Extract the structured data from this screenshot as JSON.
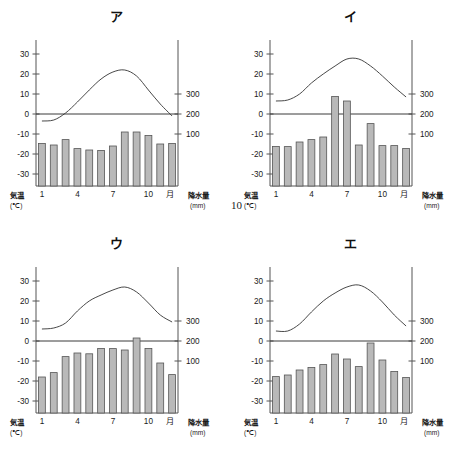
{
  "figure": {
    "page_number": "10",
    "axis": {
      "left_caption": "気温",
      "left_unit": "(℃)",
      "right_caption": "降水量",
      "right_unit": "(mm)",
      "month_caption": "月",
      "temp_ticks": [
        "30",
        "20",
        "10",
        "0",
        "-10",
        "-20",
        "-30"
      ],
      "precip_ticks": [
        "300",
        "200",
        "100"
      ],
      "month_ticks": [
        "1",
        "4",
        "7",
        "10"
      ]
    },
    "colors": {
      "bar_fill": "#b9b9b9",
      "bar_stroke": "#555555",
      "axis": "#555555",
      "curve": "#333333",
      "text": "#1a1a1a"
    }
  },
  "chart_data": [
    {
      "type": "bar",
      "title": "ア",
      "xlabel": "月",
      "ylabel": "気温 (℃)",
      "y2label": "降水量 (mm)",
      "categories": [
        "1",
        "2",
        "3",
        "4",
        "5",
        "6",
        "7",
        "8",
        "9",
        "10",
        "11",
        "12"
      ],
      "ylim": [
        -36,
        34
      ],
      "y2lim": [
        -320,
        1080
      ],
      "grid": false,
      "legend": "none",
      "series": [
        {
          "name": "降水量",
          "kind": "bar",
          "unit": "mm",
          "values": [
            53,
            45,
            72,
            27,
            20,
            18,
            40,
            110,
            110,
            93,
            50,
            53
          ]
        },
        {
          "name": "気温",
          "kind": "line",
          "unit": "℃",
          "values": [
            -3.5,
            -3.0,
            0.5,
            6.0,
            12.0,
            17.5,
            21.0,
            22.0,
            19.0,
            12.0,
            5.0,
            -1.0
          ]
        }
      ]
    },
    {
      "type": "bar",
      "title": "イ",
      "xlabel": "月",
      "ylabel": "気温 (℃)",
      "y2label": "降水量 (mm)",
      "categories": [
        "1",
        "2",
        "3",
        "4",
        "5",
        "6",
        "7",
        "8",
        "9",
        "10",
        "11",
        "12"
      ],
      "ylim": [
        -36,
        34
      ],
      "y2lim": [
        -320,
        1080
      ],
      "grid": false,
      "legend": "none",
      "series": [
        {
          "name": "降水量",
          "kind": "bar",
          "unit": "mm",
          "values": [
            38,
            37,
            60,
            72,
            85,
            288,
            265,
            45,
            152,
            42,
            42,
            28
          ]
        },
        {
          "name": "気温",
          "kind": "line",
          "unit": "℃",
          "values": [
            6.5,
            7.0,
            10.0,
            15.5,
            20.0,
            24.0,
            27.5,
            27.5,
            24.0,
            19.0,
            13.5,
            8.5
          ]
        }
      ]
    },
    {
      "type": "bar",
      "title": "ウ",
      "xlabel": "月",
      "ylabel": "気温 (℃)",
      "y2label": "降水量 (mm)",
      "categories": [
        "1",
        "2",
        "3",
        "4",
        "5",
        "6",
        "7",
        "8",
        "9",
        "10",
        "11",
        "12"
      ],
      "ylim": [
        -36,
        34
      ],
      "y2lim": [
        -320,
        1080
      ],
      "grid": false,
      "legend": "none",
      "series": [
        {
          "name": "降水量",
          "kind": "bar",
          "unit": "mm",
          "values": [
            20,
            42,
            122,
            140,
            136,
            163,
            162,
            155,
            215,
            163,
            90,
            32
          ]
        },
        {
          "name": "気温",
          "kind": "line",
          "unit": "℃",
          "values": [
            6.0,
            6.5,
            9.0,
            15.0,
            20.0,
            23.0,
            25.5,
            27.0,
            24.5,
            19.0,
            13.0,
            9.5
          ]
        }
      ]
    },
    {
      "type": "bar",
      "title": "エ",
      "xlabel": "月",
      "ylabel": "気温 (℃)",
      "y2label": "降水量 (mm)",
      "categories": [
        "1",
        "2",
        "3",
        "4",
        "5",
        "6",
        "7",
        "8",
        "9",
        "10",
        "11",
        "12"
      ],
      "ylim": [
        -36,
        34
      ],
      "y2lim": [
        -320,
        1080
      ],
      "grid": false,
      "legend": "none",
      "series": [
        {
          "name": "降水量",
          "kind": "bar",
          "unit": "mm",
          "values": [
            22,
            30,
            55,
            68,
            82,
            135,
            110,
            72,
            190,
            105,
            48,
            18
          ]
        },
        {
          "name": "気温",
          "kind": "line",
          "unit": "℃",
          "values": [
            5.0,
            5.0,
            8.5,
            14.5,
            20.0,
            24.0,
            27.0,
            28.0,
            25.0,
            19.5,
            13.0,
            7.5
          ]
        }
      ]
    }
  ]
}
